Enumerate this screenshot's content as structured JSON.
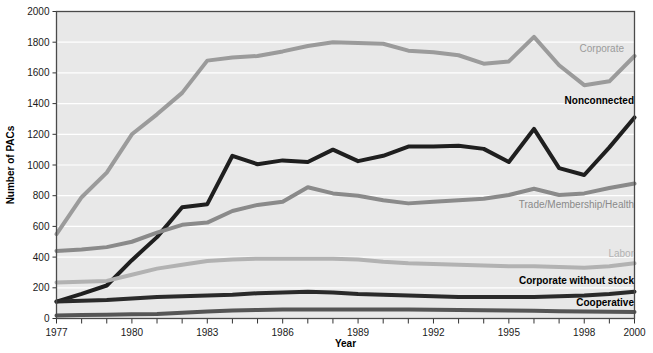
{
  "chart_data": {
    "type": "line",
    "title": "",
    "xlabel": "Year",
    "ylabel": "Number of PACs",
    "xlim": [
      1977,
      2000
    ],
    "ylim": [
      0,
      2000
    ],
    "ytick_values": [
      0,
      200,
      400,
      600,
      800,
      1000,
      1200,
      1400,
      1600,
      1800,
      2000
    ],
    "ytick_labels": [
      "0",
      "200",
      "400",
      "600",
      "800",
      "1000",
      "1200",
      "1400",
      "1600",
      "1800",
      "2000"
    ],
    "xtick_values": [
      1977,
      1980,
      1983,
      1986,
      1989,
      1992,
      1995,
      1998,
      2000
    ],
    "xtick_labels": [
      "1977",
      "1980",
      "1983",
      "1986",
      "1989",
      "1992",
      "1995",
      "1998",
      "2000"
    ],
    "xminor_step": 1,
    "grid": "horizontal-white",
    "plot_background": "#e8e8e8",
    "legend_position": "inline-right-of-line-ends",
    "x": [
      1977,
      1978,
      1979,
      1980,
      1981,
      1982,
      1983,
      1984,
      1985,
      1986,
      1987,
      1988,
      1989,
      1990,
      1991,
      1992,
      1993,
      1994,
      1995,
      1996,
      1997,
      1998,
      1999,
      2000
    ],
    "series": [
      {
        "name": "Corporate",
        "label": "Corporate",
        "color": "#9b9b9b",
        "label_color": "#9b9b9b",
        "bold_label": false,
        "width": 4,
        "values": [
          550,
          790,
          950,
          1200,
          1330,
          1470,
          1680,
          1700,
          1710,
          1740,
          1775,
          1800,
          1795,
          1790,
          1745,
          1735,
          1715,
          1660,
          1675,
          1835,
          1650,
          1520,
          1545,
          1710
        ]
      },
      {
        "name": "Nonconnected",
        "label": "Nonconnected",
        "color": "#1f1f1f",
        "label_color": "#000000",
        "bold_label": true,
        "width": 4,
        "values": [
          110,
          160,
          215,
          380,
          530,
          725,
          745,
          1060,
          1005,
          1030,
          1020,
          1100,
          1025,
          1060,
          1120,
          1120,
          1125,
          1105,
          1020,
          1235,
          980,
          935,
          1115,
          1310
        ]
      },
      {
        "name": "Trade/Membership/Health",
        "label": "Trade/Membership/Health",
        "color": "#8a8a8a",
        "label_color": "#8a8a8a",
        "bold_label": false,
        "width": 4,
        "values": [
          440,
          450,
          465,
          500,
          560,
          610,
          625,
          700,
          740,
          760,
          855,
          815,
          800,
          770,
          750,
          760,
          770,
          780,
          805,
          845,
          805,
          815,
          850,
          880
        ]
      },
      {
        "name": "Labor",
        "label": "Labor",
        "color": "#b2b2b2",
        "label_color": "#b2b2b2",
        "bold_label": false,
        "width": 4,
        "values": [
          235,
          240,
          245,
          285,
          325,
          350,
          375,
          385,
          390,
          390,
          390,
          390,
          385,
          370,
          360,
          355,
          350,
          345,
          340,
          340,
          335,
          330,
          340,
          360
        ]
      },
      {
        "name": "Corporate without stock",
        "label": "Corporate without stock",
        "color": "#2a2a2a",
        "label_color": "#000000",
        "bold_label": true,
        "width": 4,
        "values": [
          110,
          115,
          120,
          130,
          140,
          145,
          150,
          155,
          165,
          170,
          175,
          170,
          160,
          155,
          150,
          145,
          140,
          140,
          140,
          140,
          145,
          150,
          160,
          175
        ]
      },
      {
        "name": "Cooperative",
        "label": "Cooperative",
        "color": "#555555",
        "label_color": "#000000",
        "bold_label": true,
        "width": 4,
        "values": [
          20,
          22,
          25,
          28,
          30,
          38,
          45,
          52,
          56,
          58,
          59,
          59,
          59,
          59,
          58,
          57,
          56,
          54,
          52,
          50,
          48,
          46,
          44,
          42
        ]
      }
    ]
  },
  "labels": {
    "corporate": "Corporate",
    "nonconnected": "Nonconnected",
    "trade": "Trade/Membership/Health",
    "labor": "Labor",
    "corporate_without_stock": "Corporate without stock",
    "cooperative": "Cooperative"
  }
}
